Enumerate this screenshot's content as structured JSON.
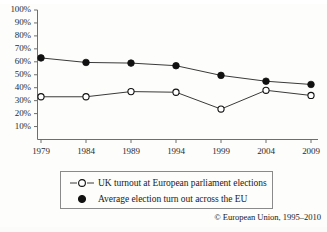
{
  "chart_data": {
    "type": "line",
    "title": "",
    "subtitle": "",
    "xlabel": "",
    "ylabel": "",
    "categories": [
      "1979",
      "1984",
      "1989",
      "1994",
      "1999",
      "2004",
      "2009"
    ],
    "x": [
      1979,
      1984,
      1989,
      1994,
      1999,
      2004,
      2009
    ],
    "xlim": [
      1979,
      2009
    ],
    "ylim": [
      0,
      100
    ],
    "ytick_labels": [
      "100%",
      "90%",
      "80%",
      "70%",
      "60%",
      "50%",
      "40%",
      "30%",
      "20%",
      "10%"
    ],
    "ytick_values": [
      100,
      90,
      80,
      70,
      60,
      50,
      40,
      30,
      20,
      10
    ],
    "grid": false,
    "legend_position": "bottom",
    "series": [
      {
        "name": "UK turnout at European parliament elections",
        "marker": "open-circle",
        "color": "#1a1a1a",
        "values": [
          33,
          33,
          37,
          36.5,
          23.5,
          38,
          34
        ]
      },
      {
        "name": "Average election turn out across the EU",
        "marker": "filled-circle",
        "color": "#111111",
        "values": [
          63,
          59.5,
          59,
          57,
          49.5,
          45,
          42.5
        ]
      }
    ]
  },
  "legend": {
    "entries": [
      {
        "marker": "open-circle-line",
        "label": "UK turnout at European parliament elections"
      },
      {
        "marker": "filled-circle",
        "label": "Average election turn out across the EU"
      }
    ]
  },
  "credit": {
    "text": "© European Union, 1995–2010"
  },
  "colors": {
    "axis": "#6e6e6e",
    "line": "#3a3a3a",
    "marker_fill": "#111111",
    "marker_open_fill": "#ffffff",
    "text": "#1a1a1a",
    "background": "#fdfdfb",
    "legend_border": "#8a8a8a"
  }
}
